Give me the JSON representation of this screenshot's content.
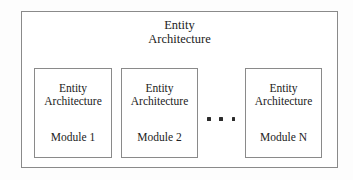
{
  "diagram": {
    "type": "block-diagram",
    "title_lines": [
      "Entity",
      "Architecture"
    ],
    "container": {
      "name": "entity-architecture-system",
      "label_line_1": "Entity",
      "label_line_2": "Architecture"
    },
    "modules": [
      {
        "head_line_1": "Entity",
        "head_line_2": "Architecture",
        "label": "Module 1"
      },
      {
        "head_line_1": "Entity",
        "head_line_2": "Architecture",
        "label": "Module 2"
      },
      {
        "head_line_1": "Entity",
        "head_line_2": "Architecture",
        "label": "Module N"
      }
    ],
    "ellipsis": {
      "symbol": "...",
      "dot_count": 3,
      "meaning": "additional modules omitted"
    },
    "colors": {
      "background": "#fdfdfd",
      "box_fill": "#ffffff",
      "border": "#8a8a8a",
      "text": "#222222",
      "dot": "#2b2b2b"
    }
  }
}
